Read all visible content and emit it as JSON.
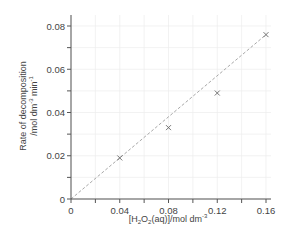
{
  "chart_data": {
    "type": "scatter",
    "title": "",
    "xlabel": "[H2O2(aq)]/mol dm-3",
    "ylabel": "Rate of decomposition /mol dm-3 min-1",
    "xlim": [
      0,
      0.16
    ],
    "ylim": [
      0,
      0.08
    ],
    "x_ticks": [
      "0",
      "0.04",
      "0.08",
      "0.12",
      "0.16"
    ],
    "y_ticks": [
      "0",
      "0.02",
      "0.04",
      "0.06",
      "0.08"
    ],
    "grid": true,
    "legend": null,
    "series": [
      {
        "name": "measured rate",
        "marker": "x",
        "x": [
          0.04,
          0.08,
          0.12,
          0.16
        ],
        "y": [
          0.019,
          0.033,
          0.049,
          0.076
        ]
      },
      {
        "name": "line of best fit",
        "style": "dashed",
        "x": [
          0,
          0.16
        ],
        "y": [
          0,
          0.076
        ]
      }
    ]
  },
  "labels": {
    "x_axis": {
      "parts": [
        "[H",
        "2",
        "O",
        "2",
        "(aq)]/mol dm",
        "-3"
      ]
    },
    "y_axis": {
      "line1": "Rate of decomposition",
      "line2_parts": [
        "/mol dm",
        "-3",
        " min",
        "-1"
      ]
    },
    "x_ticks": [
      "0",
      "0.04",
      "0.08",
      "0.12",
      "0.16"
    ],
    "y_ticks": [
      "0",
      "0.02",
      "0.04",
      "0.06",
      "0.08"
    ]
  },
  "colors": {
    "axis": "#555555",
    "grid": "#ececec",
    "fit_line": "#a8a8a8",
    "marker": "#666666",
    "text": "#444444"
  }
}
